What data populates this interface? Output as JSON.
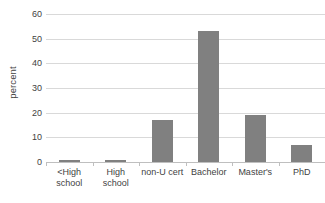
{
  "chart_data": {
    "type": "bar",
    "title": "",
    "subtitle": "",
    "xlabel": "",
    "ylabel": "percent",
    "categories": [
      "<High school",
      "High school",
      "non-U cert",
      "Bachelor",
      "Master's",
      "PhD"
    ],
    "values": [
      1,
      1,
      17,
      53,
      19,
      7
    ],
    "series": [
      {
        "name": "percent",
        "values": [
          1,
          1,
          17,
          53,
          19,
          7
        ]
      }
    ],
    "ylim": [
      0,
      60
    ],
    "ytick_labels": [
      "0",
      "10",
      "20",
      "30",
      "40",
      "50",
      "60"
    ],
    "ytick_values": [
      0,
      10,
      20,
      30,
      40,
      50,
      60
    ],
    "grid": true,
    "grid_axis": "y",
    "legend": false,
    "legend_position": "none",
    "bar_color": "#808080",
    "gridline_color": "#d9d9d9",
    "axis_color": "#bfbfbf",
    "text_color": "#3f3f3f",
    "background_color": "#ffffff"
  }
}
